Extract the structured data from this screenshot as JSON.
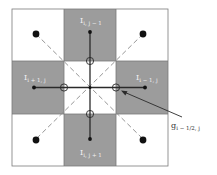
{
  "diagram": {
    "grid": {
      "origin_x": 12,
      "origin_y": 9,
      "cell": 52.3,
      "cols": 3,
      "rows": 3
    },
    "colors": {
      "shaded": "#9c9c9c",
      "white": "#ffffff",
      "border": "#666666",
      "solid_line": "#2a2a2a",
      "dashed_line": "#8a8a8a",
      "dot": "#111111",
      "label": "#f2f2f2",
      "annotation": "#333333"
    },
    "cells": [
      {
        "row": 0,
        "col": 0,
        "shaded": false
      },
      {
        "row": 0,
        "col": 1,
        "shaded": true,
        "label": "I_{i, j − 1}"
      },
      {
        "row": 0,
        "col": 2,
        "shaded": false
      },
      {
        "row": 1,
        "col": 0,
        "shaded": true,
        "label": "I_{i + 1, j}"
      },
      {
        "row": 1,
        "col": 1,
        "shaded": false
      },
      {
        "row": 1,
        "col": 2,
        "shaded": true,
        "label": "I_{i − 1, j}"
      },
      {
        "row": 2,
        "col": 0,
        "shaded": false
      },
      {
        "row": 2,
        "col": 1,
        "shaded": true,
        "label": "I_{i, j + 1}"
      },
      {
        "row": 2,
        "col": 2,
        "shaded": false
      }
    ],
    "labels": {
      "top": {
        "main": "I",
        "sub": "i, j − 1"
      },
      "left": {
        "main": "I",
        "sub": "i + 1, j"
      },
      "right": {
        "main": "I",
        "sub": "i − 1, j"
      },
      "bottom": {
        "main": "I",
        "sub": "i, j + 1"
      }
    },
    "annotation": {
      "main": "g",
      "sub": "i − 1/2, j"
    }
  }
}
